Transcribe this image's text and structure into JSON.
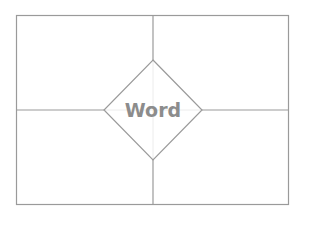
{
  "diagram": {
    "type": "frayer-model",
    "center_word": "Word",
    "quadrants": [
      {
        "position": "top-left",
        "text": ""
      },
      {
        "position": "top-right",
        "text": ""
      },
      {
        "position": "bottom-left",
        "text": ""
      },
      {
        "position": "bottom-right",
        "text": ""
      }
    ],
    "colors": {
      "line": "#9a9a9a",
      "text": "#8c8c8c",
      "guide": "#ececec",
      "background": "#ffffff"
    }
  }
}
